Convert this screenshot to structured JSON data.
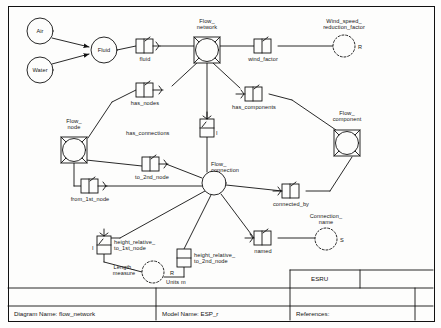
{
  "diagram": {
    "type": "express-g-entity-relationship",
    "title_block": {
      "diagram_name": "Diagram Name: flow_network",
      "model_name": "Model Name: ESP_r",
      "references": "References:",
      "organisation": "ESRU"
    },
    "entities": [
      {
        "id": "air",
        "label": "Air",
        "shape": "circle",
        "x": 40,
        "y": 31,
        "r": 13
      },
      {
        "id": "water",
        "label": "Water",
        "shape": "circle",
        "x": 40,
        "y": 70,
        "r": 13
      },
      {
        "id": "fluid",
        "label": "Fluid",
        "shape": "circle",
        "x": 104,
        "y": 50,
        "r": 13
      },
      {
        "id": "flow_network",
        "label": "Flow_\nnetwork",
        "shape": "circle-in-square",
        "x": 207,
        "y": 50,
        "r": 13
      },
      {
        "id": "flow_node",
        "label": "Flow_\nnode",
        "shape": "circle-in-square",
        "x": 74,
        "y": 150,
        "r": 13
      },
      {
        "id": "flow_component",
        "label": "Flow_\ncomponent",
        "shape": "circle-in-square",
        "x": 347,
        "y": 143,
        "r": 13
      },
      {
        "id": "flow_connection",
        "label": "Flow_\nconnection",
        "shape": "circle",
        "x": 214,
        "y": 183,
        "r": 12
      },
      {
        "id": "wind_speed",
        "label": "Wind_speed_\nreduction_factor",
        "shape": "dashed-circle",
        "x": 344,
        "y": 46,
        "r": 11,
        "cardinality": "R"
      },
      {
        "id": "connection_name",
        "label": "Connection_\nname",
        "shape": "dashed-circle",
        "x": 326,
        "y": 239,
        "r": 11,
        "cardinality": "S"
      },
      {
        "id": "length_measure",
        "label": "Length_\nmeasure",
        "shape": "dashed-circle",
        "x": 153,
        "y": 272,
        "r": 11,
        "cardinality": "R",
        "units": "Units m"
      }
    ],
    "relationships": [
      {
        "id": "fluid_rel",
        "label": "fluid",
        "orient": "h",
        "x": 144,
        "y": 46
      },
      {
        "id": "wind_factor",
        "label": "wind_factor",
        "orient": "h",
        "x": 262,
        "y": 46
      },
      {
        "id": "has_nodes",
        "label": "has_nodes",
        "orient": "h",
        "x": 144,
        "y": 90
      },
      {
        "id": "has_components",
        "label": "has_components",
        "orient": "h",
        "x": 253,
        "y": 94
      },
      {
        "id": "has_connections",
        "label": "has_connections",
        "orient": "v",
        "x": 202,
        "y": 118
      },
      {
        "id": "to_2nd_node",
        "label": "to_2nd_node",
        "orient": "h",
        "x": 150,
        "y": 164
      },
      {
        "id": "from_1st_node",
        "label": "from_1st_node",
        "orient": "h",
        "x": 89,
        "y": 186
      },
      {
        "id": "connected_by",
        "label": "connected_by",
        "orient": "h",
        "x": 290,
        "y": 191
      },
      {
        "id": "named",
        "label": "named",
        "orient": "h",
        "x": 262,
        "y": 238
      },
      {
        "id": "height_relative_to_1st",
        "label": "height_relative_\nto_1st_node",
        "orient": "v",
        "x": 104,
        "y": 245
      },
      {
        "id": "height_relative_to_2nd",
        "label": "height_relative_\nto_2nd_node",
        "orient": "v",
        "x": 184,
        "y": 258
      },
      {
        "id": "flow_net_inst",
        "label": "I",
        "orient": "v",
        "x": 207,
        "y": 127
      }
    ],
    "cardinality_marks": [
      "I",
      "R",
      "S"
    ]
  }
}
